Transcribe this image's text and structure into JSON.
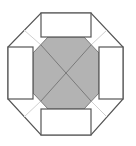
{
  "diagram": {
    "width": 136,
    "height": 146,
    "colors": {
      "background": "#ffffff",
      "outline": "#555555",
      "inner_fill": "#b3b3b3",
      "inner_diagonal": "#7a7a7a",
      "outer_diagonal": "#d0d0d0",
      "rect_fill": "#ffffff"
    },
    "outer_octagon": {
      "points": "41,13 91,13 123,47 123,99 91,135 41,135 8,99 8,47"
    },
    "inner_octagon": {
      "points": "48,37 84,37 99,53 99,93 84,109 48,109 33,93 33,53"
    },
    "rectangles": [
      {
        "name": "top-rect",
        "x": 41,
        "y": 13,
        "w": 50,
        "h": 24
      },
      {
        "name": "right-rect",
        "x": 99,
        "y": 47,
        "w": 24,
        "h": 52
      },
      {
        "name": "bottom-rect",
        "x": 41,
        "y": 109,
        "w": 50,
        "h": 26
      },
      {
        "name": "left-rect",
        "x": 8,
        "y": 47,
        "w": 25,
        "h": 52
      }
    ],
    "center": {
      "x": 66,
      "y": 73
    },
    "diagonals": [
      {
        "name": "upper-left",
        "outer": {
          "x": 24,
          "y": 30
        },
        "inner": {
          "x": 41,
          "y": 45
        }
      },
      {
        "name": "upper-right",
        "outer": {
          "x": 107,
          "y": 30
        },
        "inner": {
          "x": 91,
          "y": 45
        }
      },
      {
        "name": "lower-left",
        "outer": {
          "x": 24,
          "y": 117
        },
        "inner": {
          "x": 41,
          "y": 101
        }
      },
      {
        "name": "lower-right",
        "outer": {
          "x": 107,
          "y": 117
        },
        "inner": {
          "x": 91,
          "y": 101
        }
      }
    ]
  }
}
